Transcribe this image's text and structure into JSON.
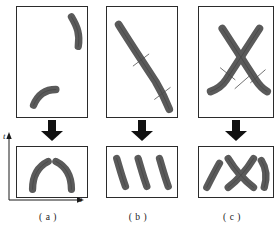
{
  "figure": {
    "type": "scientific-diagram",
    "background_color": "#ffffff",
    "stroke_color": "#5a5a5a",
    "stroke_outline_color": "#333333",
    "border_color": "#2b2b2b",
    "axes": {
      "x_label": "x",
      "t_label": "t",
      "x_arrow": "right",
      "t_arrow": "up"
    },
    "columns": [
      {
        "id": "a",
        "caption": "( a )",
        "has_axes": true,
        "top_panel": {
          "name": "two-separate-arcs",
          "stroke_count": 2,
          "tick_marks": 0,
          "strokes": [
            {
              "name": "upper-right-arc",
              "path": "M 56 10 C 62 20, 65 28, 63 40",
              "width": 7.5
            },
            {
              "name": "lower-left-arc",
              "path": "M 17 100 C 22 88, 30 84, 40 84",
              "width": 7.5
            }
          ]
        },
        "bottom_panel": {
          "name": "two-mirrored-arcs",
          "segment_count": 2,
          "strokes": [
            {
              "name": "left-arc",
              "path": "M 16 44 C 16 30, 22 20, 32 15",
              "width": 7.5
            },
            {
              "name": "right-arc",
              "path": "M 56 44 C 56 30, 50 20, 40 15",
              "width": 7.5
            }
          ]
        }
      },
      {
        "id": "b",
        "caption": "( b )",
        "has_axes": false,
        "top_panel": {
          "name": "single-long-diagonal-stroke",
          "stroke_count": 1,
          "tick_marks": 2,
          "strokes": [
            {
              "name": "long-diagonal",
              "path": "M 12 18 C 26 40, 38 58, 50 76 C 56 86, 60 94, 64 104",
              "width": 8
            }
          ],
          "ticks": [
            {
              "name": "tick-upper",
              "x": 35,
              "y": 54,
              "angle": -42
            },
            {
              "name": "tick-lower",
              "x": 57,
              "y": 88,
              "angle": -30
            }
          ]
        },
        "bottom_panel": {
          "name": "three-diagonal-segments",
          "segment_count": 3,
          "strokes": [
            {
              "name": "segment-left",
              "path": "M 10 12 C 13 22, 15 30, 19 41",
              "width": 7.5
            },
            {
              "name": "segment-middle",
              "path": "M 32 12 C 35 22, 37 30, 41 41",
              "width": 7.5
            },
            {
              "name": "segment-right",
              "path": "M 54 12 C 57 22, 59 30, 63 41",
              "width": 7.5
            }
          ]
        }
      },
      {
        "id": "c",
        "caption": "( c )",
        "has_axes": false,
        "top_panel": {
          "name": "crossing-x-shape",
          "stroke_count": 2,
          "tick_marks": 3,
          "strokes": [
            {
              "name": "stroke-down-right",
              "path": "M 24 22 C 32 34, 46 56, 58 74 C 62 80, 66 84, 70 86",
              "width": 8
            },
            {
              "name": "stroke-down-left",
              "path": "M 62 22 C 54 34, 40 56, 28 74 C 24 80, 18 84, 12 86",
              "width": 8
            }
          ],
          "ticks": [
            {
              "name": "tick-left",
              "x": 29,
              "y": 68,
              "angle": 40
            },
            {
              "name": "tick-center",
              "x": 44,
              "y": 76,
              "angle": -40
            },
            {
              "name": "tick-right",
              "x": 60,
              "y": 70,
              "angle": -40
            }
          ]
        },
        "bottom_panel": {
          "name": "split-x-with-flanking-segments",
          "segment_count": 4,
          "strokes": [
            {
              "name": "flank-left",
              "path": "M 8 42 C 12 34, 16 26, 21 17",
              "width": 7.5
            },
            {
              "name": "x-left-limb",
              "path": "M 30 12 C 36 22, 46 34, 56 42",
              "width": 7.5
            },
            {
              "name": "x-right-limb",
              "path": "M 56 12 C 50 22, 40 34, 30 42",
              "width": 7.5
            },
            {
              "name": "flank-right",
              "path": "M 64 14 C 69 22, 70 32, 67 42",
              "width": 7.5
            }
          ]
        }
      }
    ]
  }
}
